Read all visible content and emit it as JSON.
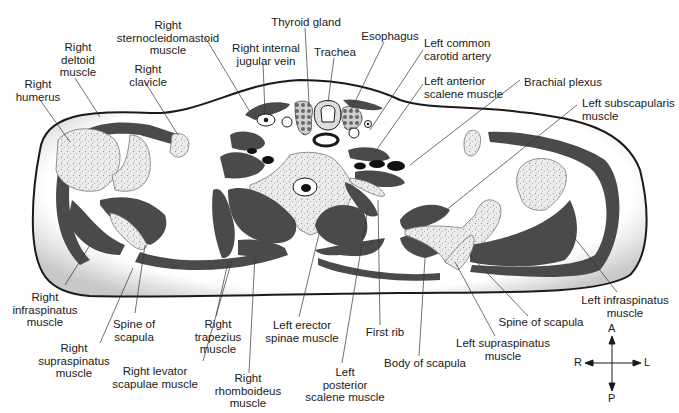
{
  "figure": {
    "type": "axial cross-section diagram",
    "colors": {
      "muscle": "#4a4a4a",
      "bone": "#ececec",
      "bone_stipple": "#9a9a9a",
      "body_fill": "#ffffff",
      "body_edge_shade": "#cfcfcf",
      "outline": "#1a1a1a",
      "label_text": "#1a1a1a"
    }
  },
  "labels": {
    "right_sternocleidomastoid": "Right\nsternocleidomastoid\nmuscle",
    "right_deltoid": "Right\ndeltoid\nmuscle",
    "right_humerus": "Right\nhumerus",
    "right_clavicle": "Right\nclavicle",
    "right_internal_jugular": "Right internal\njugular vein",
    "thyroid_gland": "Thyroid gland",
    "trachea": "Trachea",
    "esophagus": "Esophagus",
    "left_common_carotid": "Left common\ncarotid artery",
    "left_anterior_scalene": "Left anterior\nscalene muscle",
    "brachial_plexus": "Brachial plexus",
    "left_subscapularis": "Left subscapularis\nmuscle",
    "right_infraspinatus": "Right\ninfraspinatus\nmuscle",
    "right_supraspinatus": "Right\nsupraspinatus\nmuscle",
    "spine_of_scapula_right": "Spine of\nscapula",
    "right_levator_scapulae": "Right levator\nscapulae muscle",
    "right_trapezius": "Right\ntrapezius\nmuscle",
    "right_rhomboideus": "Right\nrhomboideus\nmuscle",
    "left_erector_spinae": "Left erector\nspinae muscle",
    "left_posterior_scalene": "Left\nposterior\nscalene muscle",
    "first_rib": "First rib",
    "body_of_scapula": "Body of scapula",
    "left_supraspinatus": "Left supraspinatus\nmuscle",
    "spine_of_scapula_left": "Spine of scapula",
    "left_infraspinatus": "Left infraspinatus\nmuscle"
  },
  "compass": {
    "anterior": "A",
    "posterior": "P",
    "right": "R",
    "left": "L"
  }
}
